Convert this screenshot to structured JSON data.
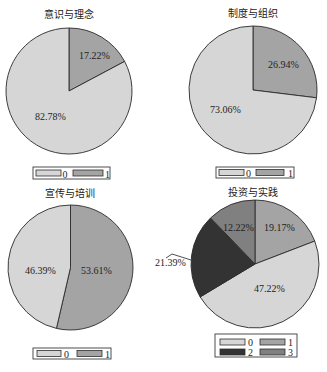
{
  "chart_data": [
    {
      "type": "pie",
      "title": "意识与理念",
      "categories": [
        "0",
        "1"
      ],
      "values": [
        82.78,
        17.22
      ],
      "labels": [
        "82.78%",
        "17.22%"
      ],
      "legend": {
        "entries": [
          "0",
          "1"
        ],
        "position": "bottom"
      },
      "start_angle_deg": 90,
      "direction": "clockwise",
      "slice_order": [
        "1",
        "0"
      ],
      "colors": {
        "0": "#d6d6d6",
        "1": "#a4a4a4"
      }
    },
    {
      "type": "pie",
      "title": "制度与组织",
      "categories": [
        "0",
        "1"
      ],
      "values": [
        73.06,
        26.94
      ],
      "labels": [
        "73.06%",
        "26.94%"
      ],
      "legend": {
        "entries": [
          "0",
          "1"
        ],
        "position": "bottom"
      },
      "start_angle_deg": 90,
      "direction": "clockwise",
      "slice_order": [
        "1",
        "0"
      ],
      "colors": {
        "0": "#d6d6d6",
        "1": "#a4a4a4"
      }
    },
    {
      "type": "pie",
      "title": "宣传与培训",
      "categories": [
        "0",
        "1"
      ],
      "values": [
        46.39,
        53.61
      ],
      "labels": [
        "46.39%",
        "53.61%"
      ],
      "legend": {
        "entries": [
          "0",
          "1"
        ],
        "position": "bottom"
      },
      "start_angle_deg": 90,
      "direction": "clockwise",
      "slice_order": [
        "1",
        "0"
      ],
      "colors": {
        "0": "#d6d6d6",
        "1": "#a4a4a4"
      }
    },
    {
      "type": "pie",
      "title": "投资与实践",
      "categories": [
        "0",
        "1",
        "2",
        "3"
      ],
      "values": [
        47.22,
        19.17,
        21.39,
        12.22
      ],
      "labels": [
        "47.22%",
        "19.17%",
        "21.39%",
        "12.22%"
      ],
      "legend": {
        "entries": [
          "0",
          "1",
          "2",
          "3"
        ],
        "position": "bottom"
      },
      "start_angle_deg": 90,
      "direction": "clockwise",
      "slice_order": [
        "1",
        "0",
        "2",
        "3"
      ],
      "colors": {
        "0": "#d6d6d6",
        "1": "#a4a4a4",
        "2": "pattern:dots",
        "3": "#808080"
      }
    }
  ]
}
